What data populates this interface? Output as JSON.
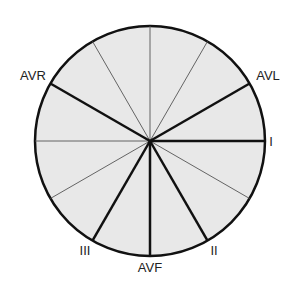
{
  "diagram": {
    "center": [
      150,
      141
    ],
    "radius": 115,
    "fill_color": "#e8e8e8",
    "stroke_color": "#111111",
    "thin_stroke_color": "#555555",
    "leads": [
      {
        "name": "I",
        "angle": 0,
        "label_x": 271,
        "label_y": 146,
        "anchor": "middle"
      },
      {
        "name": "AVL",
        "angle": -30,
        "label_x": 268,
        "label_y": 80,
        "anchor": "middle"
      },
      {
        "name": "II",
        "angle": 60,
        "label_x": 214,
        "label_y": 255,
        "anchor": "middle"
      },
      {
        "name": "AVF",
        "angle": 90,
        "label_x": 150,
        "label_y": 272,
        "anchor": "middle"
      },
      {
        "name": "III",
        "angle": 120,
        "label_x": 85,
        "label_y": 255,
        "anchor": "middle"
      },
      {
        "name": "AVR",
        "angle": -150,
        "label_x": 33,
        "label_y": 80,
        "anchor": "middle"
      }
    ],
    "thin_axes": [
      30,
      150,
      180,
      -60,
      -90,
      -120
    ]
  }
}
